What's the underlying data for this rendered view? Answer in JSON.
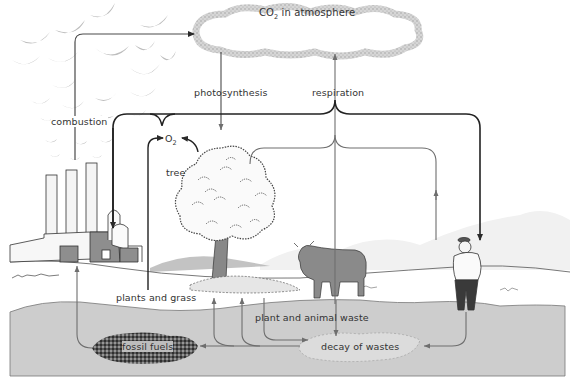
{
  "diagram": {
    "labels": {
      "atmosphere": {
        "prefix": "CO",
        "sub": "2",
        "suffix": " in atmosphere"
      },
      "photosynthesis": "photosynthesis",
      "respiration": "respiration",
      "combustion": "combustion",
      "oxygen": {
        "prefix": "O",
        "sub": "2"
      },
      "tree": "tree",
      "plants_and_grass": "plants and grass",
      "plant_and_animal_waste": "plant and animal waste",
      "fossil_fuels": "fossil fuels",
      "decay_of_wastes": "decay of wastes"
    },
    "elements": [
      "factory-smokestacks",
      "smoke-clouds",
      "co2-cloud",
      "tree",
      "cow",
      "man",
      "ground",
      "soil-layer",
      "fossil-fuel-deposit",
      "decay-area"
    ],
    "colors": {
      "arrow_dark": "#2a2a2a",
      "arrow_gray": "#6e6e6e",
      "smoke": "#b8b8b8",
      "soil": "#cfcfcf",
      "fossil": "#3a3a3a",
      "cow": "#8a8a8a"
    }
  }
}
